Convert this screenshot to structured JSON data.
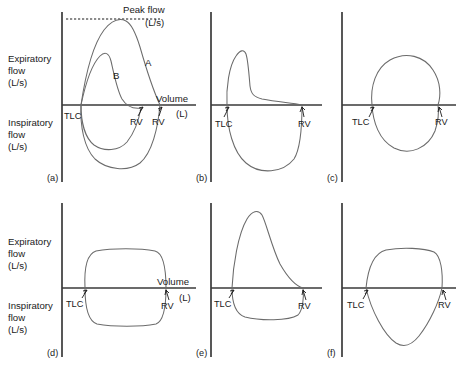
{
  "figure": {
    "title_present": false,
    "background_color": "#ffffff",
    "curve_color": "#6b6b6b",
    "axis_color": "#3a3a3a",
    "text_color": "#1a1a1a"
  },
  "axes": {
    "expiratory": {
      "line1": "Expiratory",
      "line2": "flow",
      "line3": "(L/s)"
    },
    "inspiratory": {
      "line1": "Inspiratory",
      "line2": "flow",
      "line3": "(L/s)"
    },
    "volume": {
      "line1": "Volume",
      "line2": "(L)"
    }
  },
  "annotations": {
    "peak_flow": {
      "line1": "Peak flow",
      "line2": "(L/s)"
    },
    "tlc": "TLC",
    "rv": "RV",
    "curve_a": "A",
    "curve_b": "B"
  },
  "panels": [
    {
      "id": "a",
      "letter": "(a)",
      "description": "normal flow-volume loop with two curves A and B",
      "labels": [
        "TLC",
        "RV",
        "RV",
        "A",
        "B"
      ],
      "has_peak_flow_line": true,
      "has_volume_label": true,
      "has_flow_labels": true
    },
    {
      "id": "b",
      "letter": "(b)",
      "description": "obstructive pattern with sharp peak and concave expiratory limb",
      "labels": [
        "TLC",
        "RV"
      ],
      "has_peak_flow_line": false,
      "has_volume_label": false,
      "has_flow_labels": false
    },
    {
      "id": "c",
      "letter": "(c)",
      "description": "rounded oval loop, reduced flows",
      "labels": [
        "TLC",
        "RV"
      ],
      "has_peak_flow_line": false,
      "has_volume_label": false,
      "has_flow_labels": false
    },
    {
      "id": "d",
      "letter": "(d)",
      "description": "fixed obstruction, flattened expiratory and inspiratory plateaus",
      "labels": [
        "TLC",
        "RV"
      ],
      "has_peak_flow_line": false,
      "has_volume_label": true,
      "has_flow_labels": true
    },
    {
      "id": "e",
      "letter": "(e)",
      "description": "variable extrathoracic obstruction, tall expiratory peak with flattened inspiratory limb",
      "labels": [
        "TLC",
        "RV"
      ],
      "has_peak_flow_line": false,
      "has_volume_label": false,
      "has_flow_labels": false
    },
    {
      "id": "f",
      "letter": "(f)",
      "description": "variable intrathoracic obstruction, expiratory plateau with deep inspiratory curve",
      "labels": [
        "TLC",
        "RV"
      ],
      "has_peak_flow_line": false,
      "has_volume_label": false,
      "has_flow_labels": false
    }
  ]
}
